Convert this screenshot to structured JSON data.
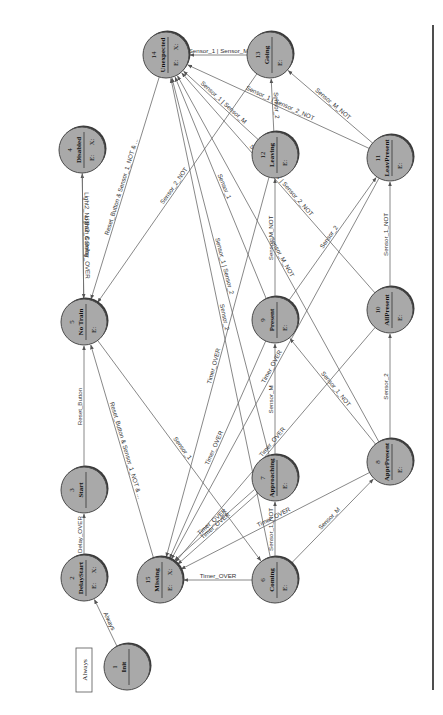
{
  "diagram": {
    "type": "state-machine",
    "orientation": "rotated-90-ccw",
    "legend_box": "Always",
    "nodes": [
      {
        "id": 1,
        "name": "Init",
        "x": 127,
        "y": 667,
        "marks": ""
      },
      {
        "id": 2,
        "name": "DelayStart",
        "x": 84,
        "y": 578,
        "marks": "E: X:"
      },
      {
        "id": 3,
        "name": "Start",
        "x": 84,
        "y": 490,
        "marks": ""
      },
      {
        "id": 4,
        "name": "Disabled",
        "x": 82,
        "y": 150,
        "marks": "E: X:"
      },
      {
        "id": 5,
        "name": "No Train",
        "x": 84,
        "y": 322,
        "marks": "E:"
      },
      {
        "id": 6,
        "name": "Coming",
        "x": 275,
        "y": 580,
        "marks": "E:"
      },
      {
        "id": 7,
        "name": "Approaching",
        "x": 275,
        "y": 478,
        "marks": "E:"
      },
      {
        "id": 8,
        "name": "ApprPresent",
        "x": 390,
        "y": 462,
        "marks": "E:"
      },
      {
        "id": 9,
        "name": "Present",
        "x": 275,
        "y": 320,
        "marks": "E:"
      },
      {
        "id": 10,
        "name": "AllPresent",
        "x": 390,
        "y": 310,
        "marks": "E:"
      },
      {
        "id": 11,
        "name": "LeavPresent",
        "x": 390,
        "y": 158,
        "marks": "E:"
      },
      {
        "id": 12,
        "name": "Leaving",
        "x": 275,
        "y": 155,
        "marks": "E:"
      },
      {
        "id": 13,
        "name": "Going",
        "x": 270,
        "y": 55,
        "marks": "E:"
      },
      {
        "id": 14,
        "name": "Unexpected",
        "x": 166,
        "y": 55,
        "marks": "E: X:"
      },
      {
        "id": 15,
        "name": "Missing",
        "x": 160,
        "y": 580,
        "marks": "E: X:"
      }
    ],
    "transitions": [
      {
        "from": 1,
        "to": 2,
        "label": "Always"
      },
      {
        "from": 2,
        "to": 3,
        "label": "Delay_OVER"
      },
      {
        "from": 3,
        "to": 5,
        "label": "Reset_Button"
      },
      {
        "from": 15,
        "to": 5,
        "label": "Reset_Button & Sensor_1_NOT & ..."
      },
      {
        "from": 14,
        "to": 5,
        "label": "Reset_Button & Sensor_1_NOT & ..."
      },
      {
        "from": 5,
        "to": 4,
        "label": "Light2_Coming"
      },
      {
        "from": 4,
        "to": 5,
        "label": "Light2_NoTrain & Delay_OVER"
      },
      {
        "from": 13,
        "to": 5,
        "label": "Sensor_2_NOT"
      },
      {
        "from": 5,
        "to": 6,
        "label": "Sensor_1"
      },
      {
        "from": 6,
        "to": 15,
        "label": "Timer_OVER"
      },
      {
        "from": 6,
        "to": 7,
        "label": "Sensor_1_NOT"
      },
      {
        "from": 6,
        "to": 8,
        "label": "Sensor_M"
      },
      {
        "from": 7,
        "to": 9,
        "label": "Sensor_M"
      },
      {
        "from": 8,
        "to": 10,
        "label": "Sensor_2"
      },
      {
        "from": 8,
        "to": 9,
        "label": "Sensor_1_NOT"
      },
      {
        "from": 9,
        "to": 12,
        "label": "Sensor_M_NOT"
      },
      {
        "from": 9,
        "to": 11,
        "label": "Sensor_2"
      },
      {
        "from": 10,
        "to": 11,
        "label": "Sensor_1_NOT"
      },
      {
        "from": 11,
        "to": 13,
        "label": "Sensor_M_NOT"
      },
      {
        "from": 12,
        "to": 13,
        "label": "Sensor_2"
      },
      {
        "from": 13,
        "to": 14,
        "label": "Sensor_1 | Sensor_M"
      },
      {
        "from": 11,
        "to": 14,
        "label": "Sensor_1 | Sensor_2_NOT"
      },
      {
        "from": 12,
        "to": 14,
        "label": "Sensor_1 | Sensor_M"
      },
      {
        "from": 9,
        "to": 14,
        "label": "Sensor_1"
      },
      {
        "from": 7,
        "to": 14,
        "label": "Sensor_1 | Sensor_2"
      },
      {
        "from": 6,
        "to": 14,
        "label": "Sensor_2"
      },
      {
        "from": 10,
        "to": 14,
        "label": "Sensor_M_NOT | Sensor_2_NOT"
      },
      {
        "from": 8,
        "to": 14,
        "label": "Sensor_M_NOT"
      },
      {
        "from": 7,
        "to": 15,
        "label": "Timer_OVER"
      },
      {
        "from": 9,
        "to": 15,
        "label": "Timer_OVER"
      },
      {
        "from": 12,
        "to": 15,
        "label": "Timer_OVER"
      },
      {
        "from": 8,
        "to": 15,
        "label": "Timer_OVER"
      },
      {
        "from": 10,
        "to": 15,
        "label": "Timer_OVER"
      },
      {
        "from": 11,
        "to": 15,
        "label": "Timer_OVER"
      },
      {
        "from": 7,
        "to": 15,
        "label": "Timer_OVER"
      }
    ]
  }
}
